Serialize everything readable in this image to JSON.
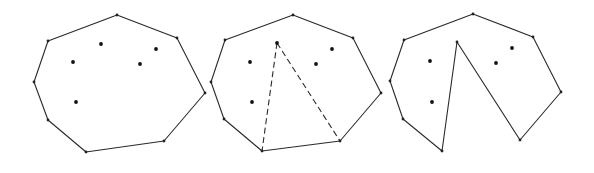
{
  "figure": {
    "colors": {
      "line": "#2a2a2a",
      "point": "#111111",
      "background": "#ffffff"
    },
    "panels": [
      {
        "name": "convex-hull",
        "hull": [
          [
            117,
            15
          ],
          [
            177,
            38
          ],
          [
            205,
            93
          ],
          [
            164,
            141
          ],
          [
            86,
            152
          ],
          [
            48,
            120
          ],
          [
            34,
            82
          ],
          [
            48,
            41
          ]
        ],
        "interior_points": [
          [
            101,
            44
          ],
          [
            73,
            62
          ],
          [
            156,
            49
          ],
          [
            140,
            64
          ],
          [
            76,
            102
          ]
        ],
        "dashed_edges": []
      },
      {
        "name": "hull-with-dashed-triangle",
        "hull": [
          [
            293,
            15
          ],
          [
            353,
            38
          ],
          [
            381,
            93
          ],
          [
            340,
            141
          ],
          [
            262,
            151
          ],
          [
            224,
            119
          ],
          [
            211,
            82
          ],
          [
            225,
            40
          ]
        ],
        "interior_points": [
          [
            277,
            43
          ],
          [
            250,
            62
          ],
          [
            332,
            49
          ],
          [
            316,
            64
          ],
          [
            252,
            102
          ]
        ],
        "dashed_edges": [
          [
            [
              277,
              43
            ],
            [
              262,
              151
            ]
          ],
          [
            [
              277,
              43
            ],
            [
              340,
              141
            ]
          ]
        ]
      },
      {
        "name": "polygon-with-inserted-point",
        "hull": [
          [
            473,
            14
          ],
          [
            533,
            37
          ],
          [
            561,
            92
          ],
          [
            520,
            140
          ],
          [
            457,
            42
          ],
          [
            442,
            151
          ],
          [
            403,
            119
          ],
          [
            390,
            81
          ],
          [
            404,
            40
          ]
        ],
        "interior_points": [
          [
            430,
            61
          ],
          [
            432,
            102
          ],
          [
            512,
            48
          ],
          [
            496,
            63
          ]
        ],
        "dashed_edges": []
      }
    ]
  }
}
